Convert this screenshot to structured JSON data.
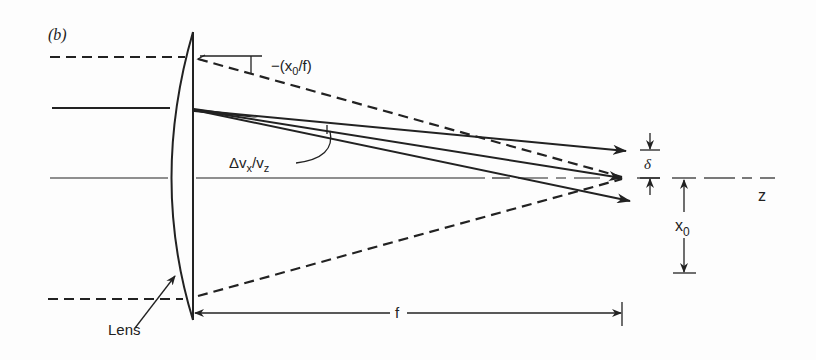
{
  "figure": {
    "panel_label": "(b)",
    "labels": {
      "angle_top": "−(x₀/f)",
      "angle_top_prefix": "−(x",
      "angle_top_sub": "0",
      "angle_top_suffix": "/f)",
      "spread_angle_main": "Δv",
      "spread_angle_sub1": "x",
      "spread_angle_mid": "/v",
      "spread_angle_sub2": "z",
      "delta": "δ",
      "axis": "z",
      "offset_main": "x",
      "offset_sub": "0",
      "focal_length": "f",
      "lens": "Lens"
    },
    "colors": {
      "ink": "#222222",
      "background": "#fdfdfd"
    }
  }
}
